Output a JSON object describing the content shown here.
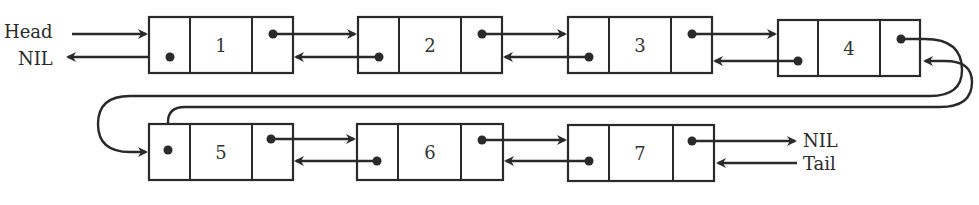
{
  "diagram": {
    "type": "doubly-linked-list",
    "labels": {
      "head": "Head",
      "head_nil": "NIL",
      "tail_nil": "NIL",
      "tail": "Tail"
    },
    "nodes": [
      {
        "value": "1",
        "row": 1
      },
      {
        "value": "2",
        "row": 1
      },
      {
        "value": "3",
        "row": 1
      },
      {
        "value": "4",
        "row": 1
      },
      {
        "value": "5",
        "row": 2
      },
      {
        "value": "6",
        "row": 2
      },
      {
        "value": "7",
        "row": 2
      }
    ],
    "colors": {
      "stroke": "#2a2a2a",
      "background": "#ffffff"
    }
  }
}
